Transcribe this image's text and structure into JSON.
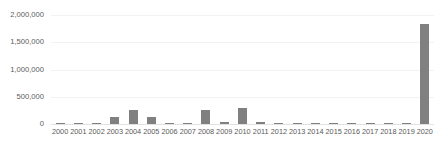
{
  "chart_data": {
    "type": "bar",
    "title": "",
    "xlabel": "",
    "ylabel": "",
    "categories": [
      "2000",
      "2001",
      "2002",
      "2003",
      "2004",
      "2005",
      "2006",
      "2007",
      "2008",
      "2009",
      "2010",
      "2011",
      "2012",
      "2013",
      "2014",
      "2015",
      "2016",
      "2017",
      "2018",
      "2019",
      "2020"
    ],
    "values": [
      18000,
      22000,
      20000,
      128000,
      255000,
      125000,
      25000,
      20000,
      250000,
      28000,
      295000,
      30000,
      14000,
      18000,
      22000,
      26000,
      20000,
      16000,
      18000,
      22000,
      1835000
    ],
    "ylim": [
      0,
      2000000
    ],
    "ytick_labels": [
      "0",
      "500,000",
      "1,000,000",
      "1,500,000",
      "2,000,000"
    ],
    "ytick_values": [
      0,
      500000,
      1000000,
      1500000,
      2000000
    ],
    "grid": true,
    "legend": "none",
    "bar_color": "#808080",
    "grid_color": "#f2f2f4",
    "axis_color": "#e2e2e5",
    "text_color": "#5a5a5a",
    "background": "#ffffff"
  }
}
